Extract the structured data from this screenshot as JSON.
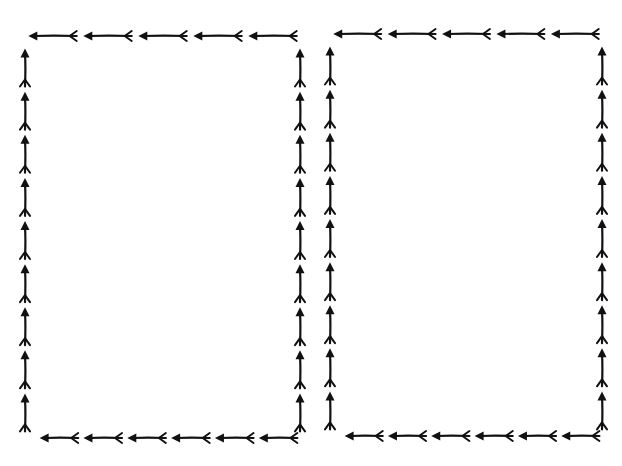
{
  "image": {
    "width": 622,
    "height": 466,
    "background": "#ffffff",
    "ink_color": "#111111",
    "description": "Two hand-drawn arrow border frames"
  },
  "frames": [
    {
      "name": "left-frame",
      "left": 25,
      "top": 36,
      "right": 300,
      "bottom": 438,
      "top_edge_arrows": 5,
      "bottom_edge_arrows": 6,
      "left_edge_arrows": 9,
      "right_edge_arrows": 9,
      "top_direction": "left",
      "bottom_direction": "left",
      "left_direction": "up",
      "right_direction": "up"
    },
    {
      "name": "right-frame",
      "left": 330,
      "top": 34,
      "right": 602,
      "bottom": 436,
      "top_edge_arrows": 5,
      "bottom_edge_arrows": 6,
      "left_edge_arrows": 9,
      "right_edge_arrows": 9,
      "top_direction": "left",
      "bottom_direction": "left",
      "left_direction": "up",
      "right_direction": "up"
    }
  ]
}
